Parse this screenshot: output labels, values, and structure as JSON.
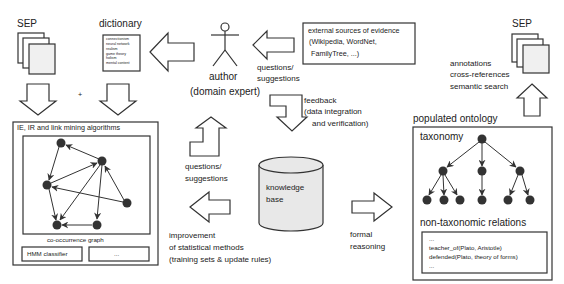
{
  "colors": {
    "stroke": "#333333",
    "node": "#333333",
    "kb_fill": "#e8e8e8",
    "page_fill": "#f0f0f0"
  },
  "sep_left": {
    "label": "SEP",
    "icon": "document-stack-icon"
  },
  "dictionary": {
    "label": "dictionary",
    "terms": [
      "connectionism",
      "neural network",
      "realism",
      "game theory",
      "holism",
      "mental content"
    ]
  },
  "plus_sign": "+",
  "author": {
    "label": "author",
    "sublabel": "(domain expert)",
    "icon": "stick-figure-icon"
  },
  "top_questions": {
    "line1": "questions/",
    "line2": "suggestions"
  },
  "external_sources": {
    "line1": "external sources of evidence",
    "line2": "(Wikipedia, WordNet,",
    "line3": "FamilyTree, ...)"
  },
  "feedback": {
    "line1": "feedback",
    "line2": "(data integration",
    "line3": "and verification)"
  },
  "sep_right": {
    "label": "SEP",
    "icon": "document-stack-icon"
  },
  "uses": {
    "line1": "annotations",
    "line2": "cross-references",
    "line3": "semantic search"
  },
  "algorithms": {
    "title": "IE, IR and link mining algorithms",
    "graph_label": "co-occurrence graph",
    "modules": [
      "HMM classifier",
      "..."
    ]
  },
  "mid_questions": {
    "line1": "questions/",
    "line2": "suggestions"
  },
  "knowledge_base": {
    "line1": "knowledge",
    "line2": "base",
    "icon": "database-cylinder-icon"
  },
  "improvement": {
    "line1": "improvement",
    "line2": "of statistical methods",
    "line3": "(training sets & update rules)"
  },
  "formal_reasoning": {
    "line1": "formal",
    "line2": "reasoning"
  },
  "ontology": {
    "title": "populated ontology",
    "taxonomy_label": "taxonomy",
    "relations_label": "non-taxonomic relations",
    "relations": [
      "...",
      "teacher_of(Plato, Aristotle)",
      "defended(Plato, theory of forms)",
      "..."
    ]
  }
}
